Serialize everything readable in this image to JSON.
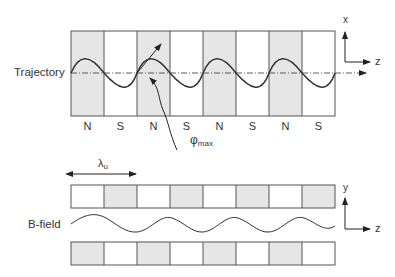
{
  "trajectory": {
    "label": "Trajectory",
    "poles": [
      "N",
      "S",
      "N",
      "S",
      "N",
      "S",
      "N",
      "S"
    ],
    "angle_label": "φ",
    "angle_subscript": "max",
    "axes": {
      "vertical": "x",
      "horizontal": "z"
    }
  },
  "bfield": {
    "label": "B-field",
    "period_label": "λ",
    "period_subscript": "u",
    "axes": {
      "vertical": "y",
      "horizontal": "z"
    }
  },
  "colors": {
    "shade": "#e6e6e6",
    "line": "#555555",
    "curve": "#333333"
  }
}
